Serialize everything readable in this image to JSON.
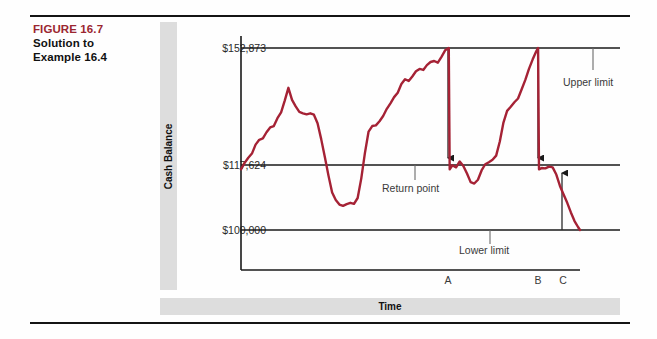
{
  "figure": {
    "label": "FIGURE 16.7",
    "title_line1": "Solution to",
    "title_line2": "Example 16.4",
    "label_color": "#9b2630"
  },
  "chart_data": {
    "type": "line",
    "title": "",
    "xlabel": "Time",
    "ylabel": "Cash Balance",
    "line_color": "#a52235",
    "grid": false,
    "legend_position": "none",
    "ylim": [
      92000,
      160000
    ],
    "y_tick_labels": [
      "$152,873",
      "$117,624",
      "$100,000"
    ],
    "y_tick_values": [
      152873,
      117624,
      100000
    ],
    "x_tick_labels": [
      "A",
      "B",
      "C"
    ],
    "reference_lines": [
      {
        "name": "upper-limit",
        "label": "Upper limit",
        "value": 152873
      },
      {
        "name": "return-point",
        "label": "Return point",
        "value": 117624
      },
      {
        "name": "lower-limit",
        "label": "Lower limit",
        "value": 100000
      }
    ],
    "annotations": [
      {
        "name": "upper-limit-annotation",
        "label": "Upper limit"
      },
      {
        "name": "return-point-annotation",
        "label": "Return point"
      },
      {
        "name": "lower-limit-annotation",
        "label": "Lower limit"
      }
    ],
    "arrows": [
      {
        "name": "arrow-a",
        "at": "A",
        "from": 152873,
        "to": 117624,
        "direction": "down"
      },
      {
        "name": "arrow-b",
        "at": "B",
        "from": 152873,
        "to": 117624,
        "direction": "down"
      },
      {
        "name": "arrow-c",
        "at": "C",
        "from": 100000,
        "to": 117624,
        "direction": "up"
      }
    ],
    "series": [
      {
        "name": "Cash Balance",
        "points": [
          [
            0,
            117624
          ],
          [
            2,
            119500
          ],
          [
            4,
            121000
          ],
          [
            6,
            122200
          ],
          [
            8,
            124800
          ],
          [
            10,
            126200
          ],
          [
            12,
            126600
          ],
          [
            14,
            128400
          ],
          [
            16,
            129800
          ],
          [
            18,
            130200
          ],
          [
            20,
            132500
          ],
          [
            22,
            134200
          ],
          [
            24,
            137600
          ],
          [
            26,
            141300
          ],
          [
            28,
            137800
          ],
          [
            30,
            135900
          ],
          [
            32,
            134300
          ],
          [
            34,
            133900
          ],
          [
            36,
            133600
          ],
          [
            38,
            133900
          ],
          [
            40,
            133500
          ],
          [
            42,
            131000
          ],
          [
            44,
            126400
          ],
          [
            46,
            121200
          ],
          [
            48,
            115800
          ],
          [
            50,
            110900
          ],
          [
            52,
            108700
          ],
          [
            54,
            107400
          ],
          [
            56,
            107000
          ],
          [
            58,
            107500
          ],
          [
            60,
            107900
          ],
          [
            62,
            107600
          ],
          [
            64,
            109300
          ],
          [
            66,
            115000
          ],
          [
            68,
            122400
          ],
          [
            70,
            128600
          ],
          [
            72,
            130200
          ],
          [
            74,
            130400
          ],
          [
            76,
            131600
          ],
          [
            78,
            133100
          ],
          [
            80,
            135200
          ],
          [
            82,
            136800
          ],
          [
            84,
            138600
          ],
          [
            86,
            139900
          ],
          [
            88,
            142400
          ],
          [
            90,
            143800
          ],
          [
            92,
            143300
          ],
          [
            94,
            144600
          ],
          [
            96,
            146100
          ],
          [
            98,
            146800
          ],
          [
            100,
            146500
          ],
          [
            102,
            147900
          ],
          [
            104,
            148800
          ],
          [
            106,
            149100
          ],
          [
            108,
            148600
          ],
          [
            110,
            150300
          ],
          [
            112,
            152200
          ],
          [
            114,
            152873
          ],
          [
            114.5,
            117624
          ],
          [
            116,
            118800
          ],
          [
            118,
            118200
          ],
          [
            120,
            119900
          ],
          [
            122,
            118600
          ],
          [
            124,
            116400
          ],
          [
            126,
            113900
          ],
          [
            128,
            113500
          ],
          [
            130,
            114600
          ],
          [
            132,
            117300
          ],
          [
            134,
            119100
          ],
          [
            136,
            119700
          ],
          [
            138,
            120400
          ],
          [
            140,
            121600
          ],
          [
            142,
            125700
          ],
          [
            144,
            131200
          ],
          [
            146,
            134600
          ],
          [
            148,
            135800
          ],
          [
            150,
            137100
          ],
          [
            152,
            138200
          ],
          [
            154,
            140900
          ],
          [
            156,
            143600
          ],
          [
            158,
            146800
          ],
          [
            160,
            149500
          ],
          [
            162,
            151900
          ],
          [
            163,
            152873
          ],
          [
            163.5,
            117624
          ],
          [
            165,
            118000
          ],
          [
            167,
            117900
          ],
          [
            169,
            118400
          ],
          [
            171,
            118200
          ],
          [
            173,
            116100
          ],
          [
            175,
            112800
          ],
          [
            177,
            110300
          ],
          [
            179,
            107900
          ],
          [
            181,
            105100
          ],
          [
            183,
            102600
          ],
          [
            185,
            100800
          ],
          [
            186,
            100000
          ]
        ]
      }
    ]
  }
}
